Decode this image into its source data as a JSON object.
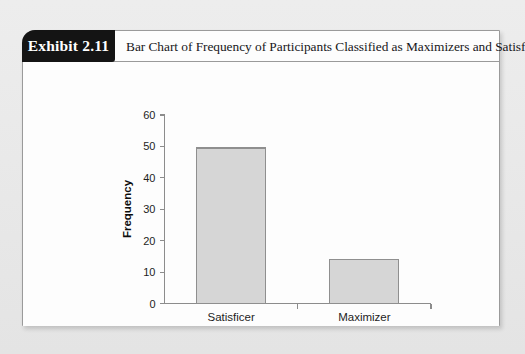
{
  "exhibit": {
    "badge_label": "Exhibit 2.11",
    "title": "Bar Chart of Frequency of Participants Classified as Maximizers and Satisficers"
  },
  "chart_data": {
    "type": "bar",
    "title": "",
    "categories": [
      "Satisficer",
      "Maximizer"
    ],
    "values": [
      49.5,
      14
    ],
    "xlabel": "Maximizer/Satisficer",
    "ylabel": "Frequency",
    "ylim": [
      0,
      60
    ],
    "yticks": [
      0,
      10,
      20,
      30,
      40,
      50,
      60
    ],
    "ytick_labels": [
      "0",
      "10",
      "20",
      "30",
      "40",
      "50",
      "60"
    ],
    "grid": false,
    "legend": null,
    "bar_fill": "#d6d6d6",
    "bar_stroke": "#8f8f8f",
    "axis_color": "#8c8c8c"
  }
}
